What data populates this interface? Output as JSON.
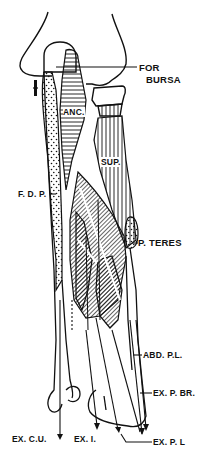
{
  "diagram": {
    "colors": {
      "ink": "#111111",
      "background": "#ffffff"
    },
    "labels": {
      "for_bursa_line1": "FOR",
      "for_bursa_line2": "BURSA",
      "anc": "ANC.",
      "sup": "SUP.",
      "fdp": "F. D. P.",
      "p_teres": "P. TERES",
      "abd_pl": "ABD. P.L.",
      "ex_pbr": "EX. P. BR.",
      "ex_cu": "EX. C.U.",
      "ex_i": "EX. I.",
      "ex_pl": "EX. P. L"
    }
  }
}
